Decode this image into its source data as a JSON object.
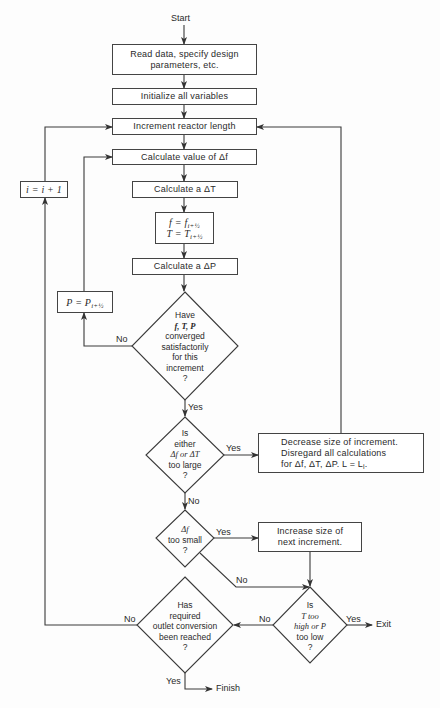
{
  "start_label": "Start",
  "finish_label": "Finish",
  "exit_label": "Exit",
  "boxes": {
    "read_data": [
      "Read data, specify design",
      "parameters, etc."
    ],
    "initialize": "Initialize all variables",
    "increment_length": "Increment reactor length",
    "calc_df": "Calculate value of Δf",
    "calc_dT": "Calculate a ΔT",
    "assign_fT": [
      "f = f",
      "i+½",
      "T = T",
      "i+½"
    ],
    "calc_dP": "Calculate a ΔP",
    "assign_P": [
      "P = P",
      "i+½"
    ],
    "increment_i": "i = i + 1",
    "decrease": [
      "Decrease size of increment.",
      "Disregard all calculations",
      "for Δf, ΔT, ΔP. L = L",
      "i",
      "."
    ],
    "increase": [
      "Increase size of",
      "next increment."
    ]
  },
  "decisions": {
    "converged": [
      "Have",
      "f, T, P",
      "converged",
      "satisfactorily",
      "for this",
      "increment",
      "?"
    ],
    "too_large": [
      "Is",
      "either",
      "Δf or ΔT",
      "too large",
      "?"
    ],
    "too_small": [
      "Δf",
      "too small",
      "?"
    ],
    "T_P_limits": [
      "Is",
      "T too",
      "high or P",
      "too low",
      "?"
    ],
    "conversion": [
      "Has",
      "required",
      "outlet conversion",
      "been reached",
      "?"
    ]
  },
  "edge_labels": {
    "yes": "Yes",
    "no": "No"
  },
  "colors": {
    "line": "#3a3a3a",
    "background": "#fdfdfd"
  }
}
